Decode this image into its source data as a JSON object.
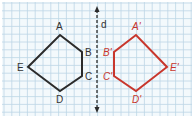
{
  "diagram": {
    "colors": {
      "grid": "#bcd6e6",
      "background": "#f3f9fc",
      "original": "#2b2b2b",
      "image": "#c8372d",
      "axis": "#2b2b2b"
    },
    "axis": {
      "label": "d",
      "x": 97,
      "y1": 6,
      "y2": 113
    },
    "original": {
      "name": "ABCDE",
      "vertices": [
        {
          "label": "A",
          "x": 60,
          "y": 35,
          "lx": 56,
          "ly": 30
        },
        {
          "label": "B",
          "x": 82,
          "y": 52,
          "lx": 85,
          "ly": 56
        },
        {
          "label": "C",
          "x": 82,
          "y": 76,
          "lx": 85,
          "ly": 80
        },
        {
          "label": "D",
          "x": 60,
          "y": 91,
          "lx": 56,
          "ly": 103
        },
        {
          "label": "E",
          "x": 28,
          "y": 67,
          "lx": 17,
          "ly": 71
        }
      ]
    },
    "image": {
      "name": "A'B'C'D'E'",
      "vertices": [
        {
          "label": "A'",
          "x": 136,
          "y": 35,
          "lx": 132,
          "ly": 30
        },
        {
          "label": "B'",
          "x": 114,
          "y": 52,
          "lx": 103,
          "ly": 56
        },
        {
          "label": "C'",
          "x": 114,
          "y": 76,
          "lx": 103,
          "ly": 80
        },
        {
          "label": "D'",
          "x": 136,
          "y": 91,
          "lx": 132,
          "ly": 103
        },
        {
          "label": "E'",
          "x": 167,
          "y": 67,
          "lx": 170,
          "ly": 71
        }
      ]
    }
  }
}
